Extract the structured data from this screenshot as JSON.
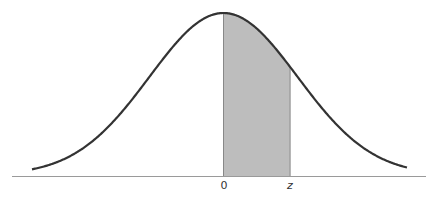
{
  "chart_data": {
    "type": "area",
    "title": "",
    "xlabel": "",
    "ylabel": "",
    "x_ticks": [
      "0",
      "z"
    ],
    "grid": false,
    "legend": null,
    "curve": {
      "distribution": "standard normal",
      "mean": 0,
      "sd": 1,
      "x_range": [
        -3.5,
        3.5
      ]
    },
    "shaded_region": {
      "from": 0,
      "to": "z",
      "z_approx": 0.9
    },
    "colors": {
      "curve": "#333333",
      "shade": "#bdbdbd",
      "axis": "#999999"
    }
  },
  "labels": {
    "origin": "0",
    "z": "z"
  }
}
